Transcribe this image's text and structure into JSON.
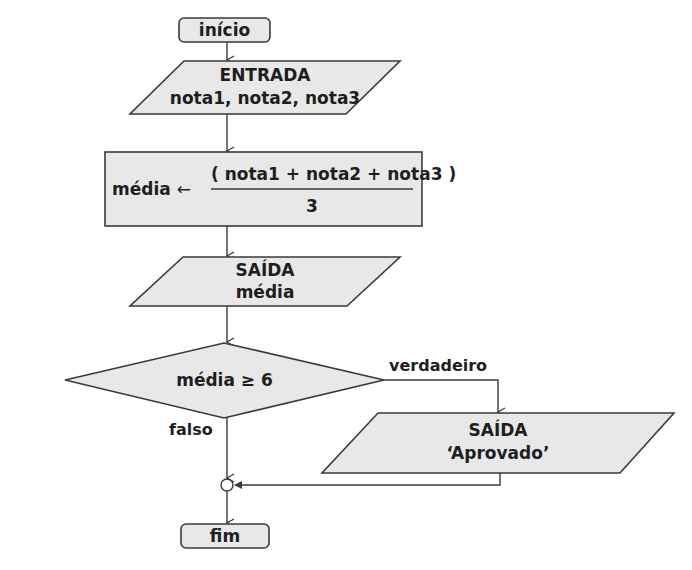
{
  "diagram": {
    "type": "flowchart",
    "nodes": {
      "start": {
        "label": "início",
        "shape": "terminator"
      },
      "input": {
        "title": "ENTRADA",
        "text": "nota1, nota2, nota3",
        "shape": "io-parallelogram"
      },
      "process": {
        "shape": "process-rect",
        "target": "média",
        "assign_symbol": "←",
        "numerator": "( nota1 + nota2 + nota3 )",
        "denominator": "3"
      },
      "output_avg": {
        "title": "SAÍDA",
        "text": "média",
        "shape": "io-parallelogram"
      },
      "decision": {
        "label": "média ≥ 6",
        "shape": "diamond"
      },
      "output_approved": {
        "title": "SAÍDA",
        "text": "‘Aprovado’",
        "shape": "io-parallelogram"
      },
      "junction": {
        "shape": "connector-circle"
      },
      "end": {
        "label": "fim",
        "shape": "terminator"
      }
    },
    "edges": {
      "true_label": "verdadeiro",
      "false_label": "falso"
    },
    "colors": {
      "fill": "#e8e8e8",
      "stroke": "#3a3a3a",
      "text": "#1e1e1e"
    }
  }
}
